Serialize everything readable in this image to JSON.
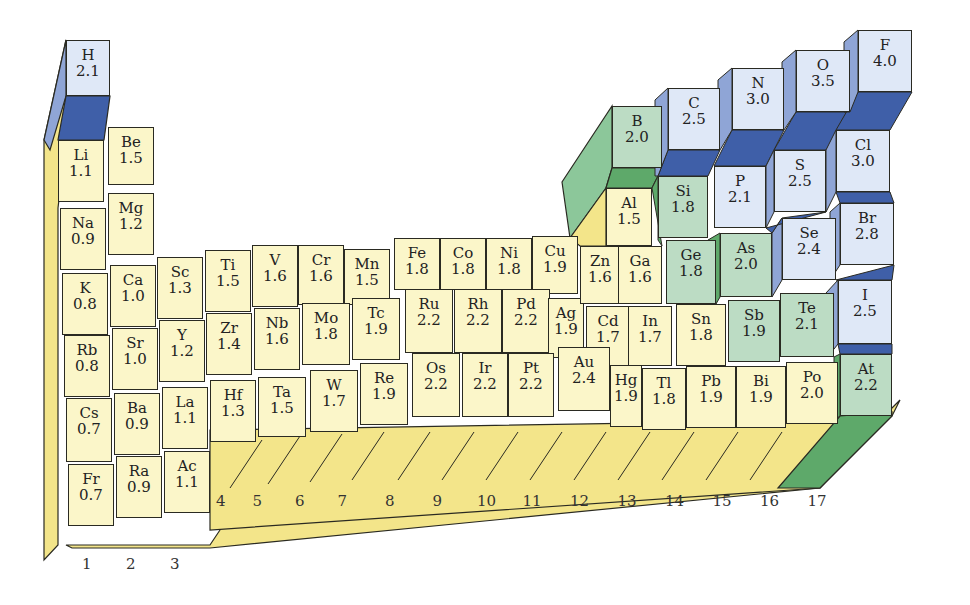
{
  "colors": {
    "metal_face": "#fbf6c9",
    "metal_side": "#f3e58a",
    "metalloid_face": "#bcdcc4",
    "metalloid_side": "#5ea96a",
    "nonmetal_face": "#dfe8f7",
    "nonmetal_side": "#8fa5d6",
    "nonmetal_top": "#3f5fa8"
  },
  "group_labels": [
    "1",
    "2",
    "3",
    "4",
    "5",
    "6",
    "7",
    "8",
    "9",
    "10",
    "11",
    "12",
    "13",
    "14",
    "15",
    "16",
    "17"
  ],
  "elements": [
    {
      "sym": "H",
      "en": "2.1",
      "type": "nonmetal",
      "x": 66,
      "y": 40,
      "w": 44,
      "h": 56
    },
    {
      "sym": "Li",
      "en": "1.1",
      "type": "metal",
      "x": 58,
      "y": 140,
      "w": 46,
      "h": 62
    },
    {
      "sym": "Be",
      "en": "1.5",
      "type": "metal",
      "x": 108,
      "y": 127,
      "w": 46,
      "h": 58
    },
    {
      "sym": "Na",
      "en": "0.9",
      "type": "metal",
      "x": 60,
      "y": 208,
      "w": 46,
      "h": 62
    },
    {
      "sym": "Mg",
      "en": "1.2",
      "type": "metal",
      "x": 108,
      "y": 193,
      "w": 46,
      "h": 62
    },
    {
      "sym": "K",
      "en": "0.8",
      "type": "metal",
      "x": 62,
      "y": 273,
      "w": 46,
      "h": 62
    },
    {
      "sym": "Ca",
      "en": "1.0",
      "type": "metal",
      "x": 110,
      "y": 265,
      "w": 46,
      "h": 62
    },
    {
      "sym": "Sc",
      "en": "1.3",
      "type": "metal",
      "x": 157,
      "y": 257,
      "w": 46,
      "h": 62
    },
    {
      "sym": "Ti",
      "en": "1.5",
      "type": "metal",
      "x": 205,
      "y": 250,
      "w": 46,
      "h": 62
    },
    {
      "sym": "V",
      "en": "1.6",
      "type": "metal",
      "x": 252,
      "y": 245,
      "w": 46,
      "h": 62
    },
    {
      "sym": "Cr",
      "en": "1.6",
      "type": "metal",
      "x": 298,
      "y": 245,
      "w": 46,
      "h": 60
    },
    {
      "sym": "Mn",
      "en": "1.5",
      "type": "metal",
      "x": 344,
      "y": 249,
      "w": 46,
      "h": 56
    },
    {
      "sym": "Fe",
      "en": "1.8",
      "type": "metal",
      "x": 394,
      "y": 238,
      "w": 46,
      "h": 52
    },
    {
      "sym": "Co",
      "en": "1.8",
      "type": "metal",
      "x": 440,
      "y": 238,
      "w": 46,
      "h": 52
    },
    {
      "sym": "Ni",
      "en": "1.8",
      "type": "metal",
      "x": 486,
      "y": 238,
      "w": 46,
      "h": 52
    },
    {
      "sym": "Cu",
      "en": "1.9",
      "type": "metal",
      "x": 532,
      "y": 236,
      "w": 46,
      "h": 58
    },
    {
      "sym": "Rb",
      "en": "0.8",
      "type": "metal",
      "x": 64,
      "y": 335,
      "w": 46,
      "h": 62
    },
    {
      "sym": "Sr",
      "en": "1.0",
      "type": "metal",
      "x": 112,
      "y": 328,
      "w": 46,
      "h": 62
    },
    {
      "sym": "Y",
      "en": "1.2",
      "type": "metal",
      "x": 159,
      "y": 320,
      "w": 46,
      "h": 62
    },
    {
      "sym": "Zr",
      "en": "1.4",
      "type": "metal",
      "x": 206,
      "y": 313,
      "w": 46,
      "h": 62
    },
    {
      "sym": "Nb",
      "en": "1.6",
      "type": "metal",
      "x": 254,
      "y": 308,
      "w": 46,
      "h": 62
    },
    {
      "sym": "Mo",
      "en": "1.8",
      "type": "metal",
      "x": 302,
      "y": 303,
      "w": 48,
      "h": 62
    },
    {
      "sym": "Tc",
      "en": "1.9",
      "type": "metal",
      "x": 352,
      "y": 298,
      "w": 48,
      "h": 62
    },
    {
      "sym": "Ru",
      "en": "2.2",
      "type": "metal",
      "x": 405,
      "y": 289,
      "w": 48,
      "h": 64
    },
    {
      "sym": "Rh",
      "en": "2.2",
      "type": "metal",
      "x": 454,
      "y": 289,
      "w": 48,
      "h": 64
    },
    {
      "sym": "Pd",
      "en": "2.2",
      "type": "metal",
      "x": 502,
      "y": 289,
      "w": 48,
      "h": 64
    },
    {
      "sym": "Ag",
      "en": "1.9",
      "type": "metal",
      "x": 548,
      "y": 298,
      "w": 36,
      "h": 60
    },
    {
      "sym": "Zn",
      "en": "1.6",
      "type": "metal",
      "x": 580,
      "y": 246,
      "w": 40,
      "h": 58
    },
    {
      "sym": "Ga",
      "en": "1.6",
      "type": "metal",
      "x": 618,
      "y": 246,
      "w": 44,
      "h": 58
    },
    {
      "sym": "Al",
      "en": "1.5",
      "type": "metal",
      "x": 606,
      "y": 188,
      "w": 46,
      "h": 58
    },
    {
      "sym": "B",
      "en": "2.0",
      "type": "metalloid",
      "x": 612,
      "y": 106,
      "w": 50,
      "h": 62
    },
    {
      "sym": "C",
      "en": "2.5",
      "type": "nonmetal",
      "x": 668,
      "y": 88,
      "w": 52,
      "h": 62
    },
    {
      "sym": "N",
      "en": "3.0",
      "type": "nonmetal",
      "x": 732,
      "y": 68,
      "w": 52,
      "h": 62
    },
    {
      "sym": "O",
      "en": "3.5",
      "type": "nonmetal",
      "x": 796,
      "y": 50,
      "w": 54,
      "h": 62
    },
    {
      "sym": "F",
      "en": "4.0",
      "type": "nonmetal",
      "x": 858,
      "y": 30,
      "w": 54,
      "h": 62
    },
    {
      "sym": "Si",
      "en": "1.8",
      "type": "metalloid",
      "x": 658,
      "y": 176,
      "w": 50,
      "h": 62
    },
    {
      "sym": "P",
      "en": "2.1",
      "type": "nonmetal",
      "x": 714,
      "y": 166,
      "w": 52,
      "h": 62
    },
    {
      "sym": "S",
      "en": "2.5",
      "type": "nonmetal",
      "x": 774,
      "y": 150,
      "w": 52,
      "h": 62
    },
    {
      "sym": "Cl",
      "en": "3.0",
      "type": "nonmetal",
      "x": 836,
      "y": 130,
      "w": 54,
      "h": 62
    },
    {
      "sym": "Ge",
      "en": "1.8",
      "type": "metalloid",
      "x": 666,
      "y": 240,
      "w": 50,
      "h": 64
    },
    {
      "sym": "As",
      "en": "2.0",
      "type": "metalloid",
      "x": 720,
      "y": 233,
      "w": 52,
      "h": 64
    },
    {
      "sym": "Se",
      "en": "2.4",
      "type": "nonmetal",
      "x": 782,
      "y": 218,
      "w": 54,
      "h": 62
    },
    {
      "sym": "Br",
      "en": "2.8",
      "type": "nonmetal",
      "x": 840,
      "y": 203,
      "w": 54,
      "h": 62
    },
    {
      "sym": "Cd",
      "en": "1.7",
      "type": "metal",
      "x": 586,
      "y": 306,
      "w": 44,
      "h": 60
    },
    {
      "sym": "In",
      "en": "1.7",
      "type": "metal",
      "x": 628,
      "y": 306,
      "w": 44,
      "h": 60
    },
    {
      "sym": "Sn",
      "en": "1.8",
      "type": "metal",
      "x": 676,
      "y": 304,
      "w": 50,
      "h": 62
    },
    {
      "sym": "Sb",
      "en": "1.9",
      "type": "metalloid",
      "x": 728,
      "y": 300,
      "w": 52,
      "h": 62
    },
    {
      "sym": "Te",
      "en": "2.1",
      "type": "metalloid",
      "x": 780,
      "y": 293,
      "w": 54,
      "h": 64
    },
    {
      "sym": "I",
      "en": "2.5",
      "type": "nonmetal",
      "x": 838,
      "y": 280,
      "w": 54,
      "h": 64
    },
    {
      "sym": "Cs",
      "en": "0.7",
      "type": "metal",
      "x": 66,
      "y": 398,
      "w": 46,
      "h": 64
    },
    {
      "sym": "Ba",
      "en": "0.9",
      "type": "metal",
      "x": 114,
      "y": 393,
      "w": 46,
      "h": 62
    },
    {
      "sym": "La",
      "en": "1.1",
      "type": "metal",
      "x": 162,
      "y": 387,
      "w": 46,
      "h": 62
    },
    {
      "sym": "Hf",
      "en": "1.3",
      "type": "metal",
      "x": 210,
      "y": 380,
      "w": 46,
      "h": 62
    },
    {
      "sym": "Ta",
      "en": "1.5",
      "type": "metal",
      "x": 258,
      "y": 377,
      "w": 48,
      "h": 60
    },
    {
      "sym": "W",
      "en": "1.7",
      "type": "metal",
      "x": 310,
      "y": 370,
      "w": 48,
      "h": 62
    },
    {
      "sym": "Re",
      "en": "1.9",
      "type": "metal",
      "x": 360,
      "y": 363,
      "w": 48,
      "h": 62
    },
    {
      "sym": "Os",
      "en": "2.2",
      "type": "metal",
      "x": 412,
      "y": 353,
      "w": 48,
      "h": 64
    },
    {
      "sym": "Ir",
      "en": "2.2",
      "type": "metal",
      "x": 462,
      "y": 353,
      "w": 46,
      "h": 64
    },
    {
      "sym": "Pt",
      "en": "2.2",
      "type": "metal",
      "x": 508,
      "y": 353,
      "w": 46,
      "h": 64
    },
    {
      "sym": "Au",
      "en": "2.4",
      "type": "metal",
      "x": 558,
      "y": 347,
      "w": 52,
      "h": 64
    },
    {
      "sym": "Hg",
      "en": "1.9",
      "type": "metal",
      "x": 610,
      "y": 365,
      "w": 32,
      "h": 62
    },
    {
      "sym": "Tl",
      "en": "1.8",
      "type": "metal",
      "x": 642,
      "y": 368,
      "w": 44,
      "h": 62
    },
    {
      "sym": "Pb",
      "en": "1.9",
      "type": "metal",
      "x": 686,
      "y": 366,
      "w": 50,
      "h": 62
    },
    {
      "sym": "Bi",
      "en": "1.9",
      "type": "metal",
      "x": 736,
      "y": 366,
      "w": 50,
      "h": 62
    },
    {
      "sym": "Po",
      "en": "2.0",
      "type": "metal",
      "x": 786,
      "y": 362,
      "w": 52,
      "h": 62
    },
    {
      "sym": "At",
      "en": "2.2",
      "type": "metalloid",
      "x": 840,
      "y": 354,
      "w": 52,
      "h": 62
    },
    {
      "sym": "Fr",
      "en": "0.7",
      "type": "metal",
      "x": 68,
      "y": 464,
      "w": 46,
      "h": 62
    },
    {
      "sym": "Ra",
      "en": "0.9",
      "type": "metal",
      "x": 116,
      "y": 456,
      "w": 46,
      "h": 62
    },
    {
      "sym": "Ac",
      "en": "1.1",
      "type": "metal",
      "x": 164,
      "y": 451,
      "w": 46,
      "h": 62
    }
  ]
}
